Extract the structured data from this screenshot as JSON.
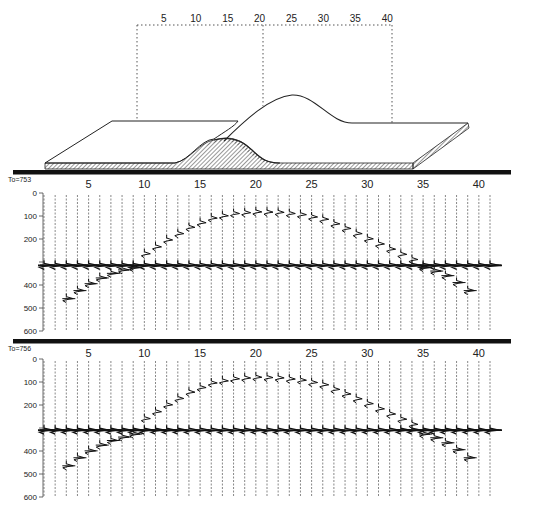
{
  "model": {
    "top_axis_labels": [
      "5",
      "10",
      "15",
      "20",
      "25",
      "30",
      "35",
      "40"
    ],
    "top_axis_x": [
      147,
      174,
      201,
      228,
      255,
      282,
      309,
      336
    ],
    "description": "Perspective block diagram of a layer with an anticline (hill) structure"
  },
  "panels": [
    {
      "id": "panel-1",
      "title": "To=753",
      "bar_y": 170,
      "axis_top": 193,
      "axis_bottom": 331,
      "y_ticks": [
        "0",
        "100",
        "200",
        "300",
        "400",
        "500",
        "600"
      ],
      "y_tick_labels_shown": [
        "0",
        "100",
        "200",
        "",
        "400",
        "500",
        "600"
      ],
      "x_labels": [
        "5",
        "10",
        "15",
        "20",
        "25",
        "30",
        "35",
        "40"
      ],
      "trace_count": 41
    },
    {
      "id": "panel-2",
      "title": "To=756",
      "bar_y": 339,
      "axis_top": 359,
      "axis_bottom": 497,
      "y_ticks": [
        "0",
        "100",
        "200",
        "300",
        "400",
        "500",
        "600"
      ],
      "y_tick_labels_shown": [
        "0",
        "100",
        "200",
        "",
        "400",
        "500",
        "600"
      ],
      "x_labels": [
        "5",
        "10",
        "15",
        "20",
        "25",
        "30",
        "35",
        "40"
      ],
      "trace_count": 41
    }
  ],
  "chart_data": {
    "type": "scatter",
    "xlabel": "Trace number",
    "ylabel": "Time",
    "xlim": [
      1,
      41
    ],
    "ylim": [
      600,
      0
    ],
    "x_ticks": [
      5,
      10,
      15,
      20,
      25,
      30,
      35,
      40
    ],
    "y_ticks": [
      0,
      100,
      200,
      300,
      400,
      500,
      600
    ],
    "series": [
      {
        "name": "To=753 anticline reflection",
        "x": [
          10,
          12,
          14,
          16,
          18,
          20,
          22,
          24,
          26,
          28,
          30,
          32,
          34
        ],
        "y": [
          260,
          200,
          145,
          105,
          85,
          78,
          80,
          90,
          110,
          150,
          195,
          240,
          285
        ]
      },
      {
        "name": "To=753 flat reflector",
        "x": [
          1,
          2,
          3,
          4,
          5,
          6,
          7,
          8,
          9,
          10,
          11,
          12,
          13,
          33,
          34,
          35,
          36,
          37,
          38,
          39,
          40,
          41
        ],
        "y": [
          310,
          310,
          310,
          310,
          310,
          310,
          310,
          310,
          310,
          310,
          310,
          310,
          310,
          310,
          310,
          310,
          310,
          310,
          310,
          310,
          310,
          310
        ]
      },
      {
        "name": "To=753 diffraction tails",
        "x": [
          3,
          4,
          5,
          6,
          7,
          8,
          9,
          35,
          36,
          37,
          38,
          39
        ],
        "y": [
          455,
          420,
          390,
          365,
          345,
          330,
          320,
          320,
          335,
          355,
          385,
          420
        ]
      },
      {
        "name": "To=756 anticline reflection",
        "x": [
          10,
          12,
          14,
          16,
          18,
          20,
          22,
          24,
          26,
          28,
          30,
          32,
          34
        ],
        "y": [
          255,
          195,
          140,
          100,
          82,
          75,
          78,
          88,
          108,
          148,
          190,
          235,
          280
        ]
      },
      {
        "name": "To=756 flat reflector",
        "x": [
          1,
          2,
          3,
          4,
          5,
          6,
          7,
          8,
          9,
          10,
          11,
          12,
          13,
          33,
          34,
          35,
          36,
          37,
          38,
          39,
          40,
          41
        ],
        "y": [
          305,
          305,
          305,
          305,
          305,
          305,
          305,
          305,
          305,
          305,
          305,
          305,
          305,
          305,
          305,
          305,
          305,
          305,
          305,
          305,
          305,
          305
        ]
      },
      {
        "name": "To=756 diffraction tails",
        "x": [
          3,
          4,
          5,
          6,
          7,
          8,
          9,
          35,
          36,
          37,
          38,
          39
        ],
        "y": [
          460,
          425,
          395,
          370,
          350,
          335,
          322,
          322,
          338,
          360,
          390,
          425
        ]
      }
    ],
    "grid": false,
    "legend": "none"
  }
}
